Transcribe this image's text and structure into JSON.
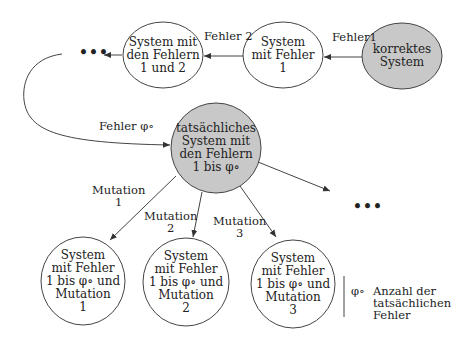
{
  "nodes": {
    "correct": "korrektes\nSystem",
    "fault1": "System\nmit Fehler\n1",
    "fault12": "System mit\nden Fehlern\n1 und 2",
    "actual": "tatsächliches\nSystem mit\nden Fehlern\n1 bis φ∘",
    "mut1": "System\nmit Fehler\n1 bis φ∘ und\nMutation\n1",
    "mut2": "System\nmit Fehler\n1 bis φ∘ und\nMutation\n2",
    "mut3": "System\nmit Fehler\n1 bis φ∘ und\nMutation\n3"
  },
  "edges": {
    "fehler1": "Fehler1",
    "fehler2": "Fehler 2",
    "fehler_phi": "Fehler φ∘",
    "mutation1": "Mutation\n1",
    "mutation2": "Mutation\n2",
    "mutation3": "Mutation\n3"
  },
  "ellipsis_top": "•••",
  "ellipsis_right": "•••",
  "legend": {
    "symbol": "φ∘",
    "text": "Anzahl der\ntatsächlichen\nFehler"
  },
  "colors": {
    "highlight_fill": "#c8c8c8",
    "stroke": "#444444"
  }
}
